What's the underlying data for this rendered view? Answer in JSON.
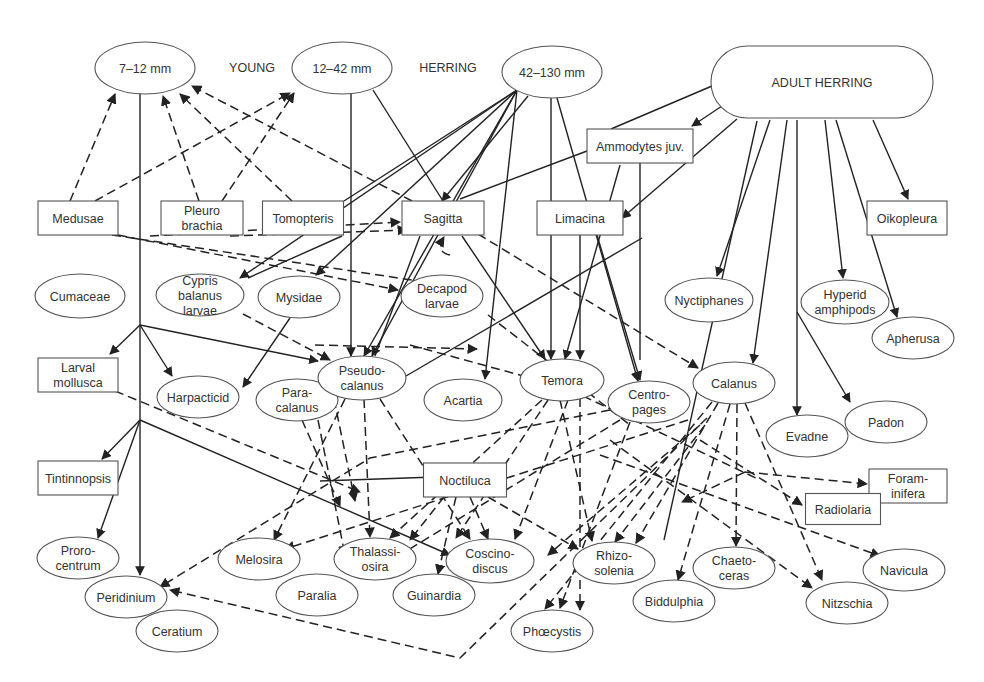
{
  "labels": {
    "young": "YOUNG",
    "herring": "HERRING"
  },
  "nodes": [
    {
      "id": "h712",
      "label": [
        "7–12 mm"
      ],
      "shape": "ellipse",
      "cx": 145,
      "cy": 68,
      "w": 100,
      "h": 52
    },
    {
      "id": "h1242",
      "label": [
        "12–42 mm"
      ],
      "shape": "ellipse",
      "cx": 342,
      "cy": 68,
      "w": 100,
      "h": 52
    },
    {
      "id": "h42130",
      "label": [
        "42–130 mm"
      ],
      "shape": "ellipse",
      "cx": 552,
      "cy": 72,
      "w": 100,
      "h": 52
    },
    {
      "id": "adult",
      "label": [
        "ADULT HERRING"
      ],
      "shape": "pill",
      "cx": 822,
      "cy": 82,
      "w": 222,
      "h": 72
    },
    {
      "id": "ammodytes",
      "label": [
        "Ammodytes juv."
      ],
      "shape": "rect",
      "cx": 640,
      "cy": 146,
      "w": 106,
      "h": 34
    },
    {
      "id": "medusae",
      "label": [
        "Medusae"
      ],
      "shape": "rect",
      "cx": 78,
      "cy": 218,
      "w": 80,
      "h": 34
    },
    {
      "id": "pleuro",
      "label": [
        "Pleuro",
        "brachia"
      ],
      "shape": "rect",
      "cx": 202,
      "cy": 218,
      "w": 82,
      "h": 34
    },
    {
      "id": "tomopteris",
      "label": [
        "Tomopteris"
      ],
      "shape": "rect",
      "cx": 303,
      "cy": 218,
      "w": 81,
      "h": 34
    },
    {
      "id": "sagitta",
      "label": [
        "Sagitta"
      ],
      "shape": "rect",
      "cx": 443,
      "cy": 218,
      "w": 82,
      "h": 34
    },
    {
      "id": "limacina",
      "label": [
        "Limacina"
      ],
      "shape": "rect",
      "cx": 580,
      "cy": 218,
      "w": 86,
      "h": 34
    },
    {
      "id": "oikopleura",
      "label": [
        "Oikopleura"
      ],
      "shape": "rect",
      "cx": 907,
      "cy": 218,
      "w": 80,
      "h": 34
    },
    {
      "id": "cumaceae",
      "label": [
        "Cumaceae"
      ],
      "shape": "ellipse",
      "cx": 80,
      "cy": 296,
      "w": 90,
      "h": 44
    },
    {
      "id": "cypris",
      "label": [
        "Cypris",
        "balanus",
        "larvae"
      ],
      "shape": "ellipse",
      "cx": 200,
      "cy": 295,
      "w": 88,
      "h": 42
    },
    {
      "id": "mysidae",
      "label": [
        "Mysidae"
      ],
      "shape": "ellipse",
      "cx": 299,
      "cy": 297,
      "w": 82,
      "h": 42
    },
    {
      "id": "decapod",
      "label": [
        "Decapod",
        "larvae"
      ],
      "shape": "ellipse",
      "cx": 442,
      "cy": 296,
      "w": 82,
      "h": 42
    },
    {
      "id": "nyctiphanes",
      "label": [
        "Nyctiphanes"
      ],
      "shape": "ellipse",
      "cx": 709,
      "cy": 300,
      "w": 88,
      "h": 44
    },
    {
      "id": "hyperid",
      "label": [
        "Hyperid",
        "amphipods"
      ],
      "shape": "ellipse",
      "cx": 845,
      "cy": 302,
      "w": 88,
      "h": 44
    },
    {
      "id": "apherusa",
      "label": [
        "Apherusa"
      ],
      "shape": "ellipse",
      "cx": 913,
      "cy": 338,
      "w": 82,
      "h": 42
    },
    {
      "id": "larvalmollusca",
      "label": [
        "Larval",
        "mollusca"
      ],
      "shape": "rect",
      "cx": 78,
      "cy": 375,
      "w": 80,
      "h": 34
    },
    {
      "id": "harpacticid",
      "label": [
        "Harpacticid"
      ],
      "shape": "ellipse",
      "cx": 198,
      "cy": 397,
      "w": 82,
      "h": 42
    },
    {
      "id": "paracalanus",
      "label": [
        "Para-",
        "calanus"
      ],
      "shape": "ellipse",
      "cx": 297,
      "cy": 400,
      "w": 82,
      "h": 42
    },
    {
      "id": "pseudocalanus",
      "label": [
        "Pseudo-",
        "calanus"
      ],
      "shape": "ellipse",
      "cx": 362,
      "cy": 378,
      "w": 88,
      "h": 44
    },
    {
      "id": "acartia",
      "label": [
        "Acartia"
      ],
      "shape": "ellipse",
      "cx": 463,
      "cy": 400,
      "w": 78,
      "h": 42
    },
    {
      "id": "temora",
      "label": [
        "Temora"
      ],
      "shape": "ellipse",
      "cx": 562,
      "cy": 380,
      "w": 84,
      "h": 42
    },
    {
      "id": "centropages",
      "label": [
        "Centro-",
        "pages"
      ],
      "shape": "ellipse",
      "cx": 649,
      "cy": 402,
      "w": 82,
      "h": 42
    },
    {
      "id": "calanus",
      "label": [
        "Calanus"
      ],
      "shape": "ellipse",
      "cx": 734,
      "cy": 383,
      "w": 82,
      "h": 42
    },
    {
      "id": "evadne",
      "label": [
        "Evadne"
      ],
      "shape": "ellipse",
      "cx": 807,
      "cy": 436,
      "w": 82,
      "h": 42
    },
    {
      "id": "padon",
      "label": [
        "Padon"
      ],
      "shape": "ellipse",
      "cx": 886,
      "cy": 422,
      "w": 82,
      "h": 42
    },
    {
      "id": "tintinnopsis",
      "label": [
        "Tintinnopsis"
      ],
      "shape": "rect",
      "cx": 78,
      "cy": 478,
      "w": 80,
      "h": 34
    },
    {
      "id": "noctiluca",
      "label": [
        "Noctiluca"
      ],
      "shape": "rect",
      "cx": 465,
      "cy": 480,
      "w": 83,
      "h": 34
    },
    {
      "id": "foraminifera",
      "label": [
        "Foram-",
        "inifera"
      ],
      "shape": "rect",
      "cx": 908,
      "cy": 486,
      "w": 78,
      "h": 34
    },
    {
      "id": "radiolaria",
      "label": [
        "Radiolaria"
      ],
      "shape": "rect",
      "cx": 843,
      "cy": 509,
      "w": 75,
      "h": 31
    },
    {
      "id": "prorocentrum",
      "label": [
        "Proro-",
        "centrum"
      ],
      "shape": "ellipse",
      "cx": 78,
      "cy": 558,
      "w": 82,
      "h": 42
    },
    {
      "id": "melosira",
      "label": [
        "Melosira"
      ],
      "shape": "ellipse",
      "cx": 259,
      "cy": 559,
      "w": 82,
      "h": 42
    },
    {
      "id": "thalassiosira",
      "label": [
        "Thalassi-",
        "osira"
      ],
      "shape": "ellipse",
      "cx": 375,
      "cy": 559,
      "w": 82,
      "h": 42
    },
    {
      "id": "coscinodiscus",
      "label": [
        "Coscino-",
        "discus"
      ],
      "shape": "ellipse",
      "cx": 490,
      "cy": 561,
      "w": 88,
      "h": 44
    },
    {
      "id": "rhizosolenia",
      "label": [
        "Rhizo-",
        "solenia"
      ],
      "shape": "ellipse",
      "cx": 614,
      "cy": 563,
      "w": 82,
      "h": 42
    },
    {
      "id": "chaetoceras",
      "label": [
        "Chaeto-",
        "ceras"
      ],
      "shape": "ellipse",
      "cx": 734,
      "cy": 568,
      "w": 82,
      "h": 42
    },
    {
      "id": "navicula",
      "label": [
        "Navicula"
      ],
      "shape": "ellipse",
      "cx": 904,
      "cy": 570,
      "w": 82,
      "h": 42
    },
    {
      "id": "peridinium",
      "label": [
        "Peridinium"
      ],
      "shape": "ellipse",
      "cx": 126,
      "cy": 597,
      "w": 82,
      "h": 42
    },
    {
      "id": "paralia",
      "label": [
        "Paralia"
      ],
      "shape": "ellipse",
      "cx": 317,
      "cy": 595,
      "w": 82,
      "h": 42
    },
    {
      "id": "guinardia",
      "label": [
        "Guinardia"
      ],
      "shape": "ellipse",
      "cx": 434,
      "cy": 595,
      "w": 82,
      "h": 42
    },
    {
      "id": "biddulphia",
      "label": [
        "Biddulphia"
      ],
      "shape": "ellipse",
      "cx": 674,
      "cy": 601,
      "w": 82,
      "h": 42
    },
    {
      "id": "nitzschia",
      "label": [
        "Nitzschia"
      ],
      "shape": "ellipse",
      "cx": 847,
      "cy": 603,
      "w": 82,
      "h": 42
    },
    {
      "id": "ceratium",
      "label": [
        "Ceratium"
      ],
      "shape": "ellipse",
      "cx": 177,
      "cy": 631,
      "w": 82,
      "h": 42
    },
    {
      "id": "phaeocystis",
      "label": [
        "Phœcystis"
      ],
      "shape": "ellipse",
      "cx": 552,
      "cy": 631,
      "w": 82,
      "h": 42
    }
  ],
  "edges": [
    {
      "d": "M 140 94 L 140 575",
      "style": "solid",
      "arrow": true
    },
    {
      "d": "M 140 325 L 110 354",
      "style": "solid",
      "arrow": true
    },
    {
      "d": "M 140 325 L 172 376",
      "style": "solid",
      "arrow": true
    },
    {
      "d": "M 140 325 L 318 361",
      "style": "solid",
      "arrow": true
    },
    {
      "d": "M 140 420 L 102 459",
      "style": "solid",
      "arrow": true
    },
    {
      "d": "M 140 420 L 98 538",
      "style": "solid",
      "arrow": true
    },
    {
      "d": "M 140 420 L 450 555",
      "style": "solid",
      "arrow": true
    },
    {
      "d": "M 351 94 L 351 356",
      "style": "solid",
      "arrow": true
    },
    {
      "d": "M 373 90 L 443 201",
      "style": "solid",
      "arrow": false
    },
    {
      "d": "M 517 90 L 344 201",
      "style": "solid",
      "arrow": false
    },
    {
      "d": "M 517 90 L 240 278",
      "style": "solid",
      "arrow": true
    },
    {
      "d": "M 517 90 L 316 275",
      "style": "solid",
      "arrow": true
    },
    {
      "d": "M 517 90 L 364 356",
      "style": "solid",
      "arrow": true
    },
    {
      "d": "M 517 90 L 372 356",
      "style": "solid",
      "arrow": true
    },
    {
      "d": "M 517 90 L 485 379",
      "style": "solid",
      "arrow": true
    },
    {
      "d": "M 528 96 L 442 201",
      "style": "solid",
      "arrow": true
    },
    {
      "d": "M 551 98 L 551 359",
      "style": "solid",
      "arrow": true
    },
    {
      "d": "M 557 98 L 638 381",
      "style": "solid",
      "arrow": true
    },
    {
      "d": "M 712 86 L 611 129",
      "style": "solid",
      "arrow": false
    },
    {
      "d": "M 722 106 L 692 126",
      "style": "solid",
      "arrow": true
    },
    {
      "d": "M 737 119 L 622 218",
      "style": "solid",
      "arrow": true
    },
    {
      "d": "M 757 121 L 664 540",
      "style": "solid",
      "arrow": false
    },
    {
      "d": "M 770 120 L 717 276",
      "style": "solid",
      "arrow": true
    },
    {
      "d": "M 787 120 L 753 363",
      "style": "solid",
      "arrow": true
    },
    {
      "d": "M 797 120 L 797 415",
      "style": "solid",
      "arrow": true
    },
    {
      "d": "M 825 120 L 843 278",
      "style": "solid",
      "arrow": true
    },
    {
      "d": "M 836 120 L 897 317",
      "style": "solid",
      "arrow": true
    },
    {
      "d": "M 873 120 L 908 199",
      "style": "solid",
      "arrow": true
    },
    {
      "d": "M 797 312 L 850 402",
      "style": "solid",
      "arrow": true
    },
    {
      "d": "M 587 151 L 460 199",
      "style": "solid",
      "arrow": false
    },
    {
      "d": "M 640 163 L 640 360",
      "style": "solid",
      "arrow": false
    },
    {
      "d": "M 620 165 L 565 359",
      "style": "solid",
      "arrow": true
    },
    {
      "d": "M 580 235 L 580 359",
      "style": "solid",
      "arrow": true
    },
    {
      "d": "M 597 235 L 640 380",
      "style": "solid",
      "arrow": true
    },
    {
      "d": "M 462 236 L 545 359",
      "style": "solid",
      "arrow": true
    },
    {
      "d": "M 420 236 L 375 356",
      "style": "solid",
      "arrow": false
    },
    {
      "d": "M 642 238 L 406 376",
      "style": "solid",
      "arrow": false
    },
    {
      "d": "M 290 318 L 243 387",
      "style": "solid",
      "arrow": true
    },
    {
      "d": "M 342 236 L 248 278",
      "style": "solid",
      "arrow": false
    },
    {
      "d": "M 464 476 L 320 481",
      "style": "solid",
      "arrow": false
    },
    {
      "d": "M 70 201 L 115 94",
      "style": "dash",
      "arrow": true
    },
    {
      "d": "M 95 201 L 290 93",
      "style": "dash",
      "arrow": true
    },
    {
      "d": "M 199 201 L 163 96",
      "style": "dash",
      "arrow": true
    },
    {
      "d": "M 222 201 L 294 93",
      "style": "dash",
      "arrow": true
    },
    {
      "d": "M 292 201 L 180 94",
      "style": "dash",
      "arrow": true
    },
    {
      "d": "M 412 201 L 192 86",
      "style": "dash",
      "arrow": true
    },
    {
      "d": "M 112 235 L 445 285",
      "style": "dash",
      "arrow": true
    },
    {
      "d": "M 118 235 L 398 290",
      "style": "dash",
      "arrow": true
    },
    {
      "d": "M 230 236 L 407 230",
      "style": "dash",
      "arrow": true
    },
    {
      "d": "M 150 236 L 400 222",
      "style": "dash",
      "arrow": true
    },
    {
      "d": "M 450 255 Q 435 252 444 237",
      "style": "dash",
      "arrow": true
    },
    {
      "d": "M 243 314 L 330 360",
      "style": "dash",
      "arrow": true
    },
    {
      "d": "M 315 345 L 477 349",
      "style": "dash",
      "arrow": true
    },
    {
      "d": "M 410 345 L 538 380",
      "style": "dash",
      "arrow": true
    },
    {
      "d": "M 478 234 L 698 368",
      "style": "dash",
      "arrow": true
    },
    {
      "d": "M 488 315 L 630 425",
      "style": "dash",
      "arrow": false
    },
    {
      "d": "M 115 391 L 360 492",
      "style": "dash",
      "arrow": true
    },
    {
      "d": "M 302 420 L 340 506",
      "style": "dash",
      "arrow": true
    },
    {
      "d": "M 318 420 L 345 555",
      "style": "dash",
      "arrow": true
    },
    {
      "d": "M 345 399 L 274 540",
      "style": "dash",
      "arrow": true
    },
    {
      "d": "M 364 399 L 370 537",
      "style": "dash",
      "arrow": true
    },
    {
      "d": "M 380 399 L 470 539",
      "style": "dash",
      "arrow": true
    },
    {
      "d": "M 334 399 L 355 501",
      "style": "dash",
      "arrow": true
    },
    {
      "d": "M 542 400 L 390 538",
      "style": "dash",
      "arrow": true
    },
    {
      "d": "M 548 400 L 456 538",
      "style": "dash",
      "arrow": true
    },
    {
      "d": "M 568 400 L 515 539",
      "style": "dash",
      "arrow": true
    },
    {
      "d": "M 580 398 L 580 610",
      "style": "dash",
      "arrow": true
    },
    {
      "d": "M 583 396 L 760 480",
      "style": "dash",
      "arrow": false
    },
    {
      "d": "M 610 410 L 370 458 L 160 587",
      "style": "dash",
      "arrow": true
    },
    {
      "d": "M 620 420 L 400 555",
      "style": "dash",
      "arrow": true
    },
    {
      "d": "M 630 422 L 560 608",
      "style": "dash",
      "arrow": true
    },
    {
      "d": "M 688 420 L 285 549",
      "style": "dash",
      "arrow": true
    },
    {
      "d": "M 700 425 L 548 555",
      "style": "dash",
      "arrow": true
    },
    {
      "d": "M 705 425 L 615 542",
      "style": "dash",
      "arrow": true
    },
    {
      "d": "M 712 402 L 545 609",
      "style": "dash",
      "arrow": true
    },
    {
      "d": "M 718 403 L 636 543",
      "style": "dash",
      "arrow": true
    },
    {
      "d": "M 730 404 L 678 580",
      "style": "dash",
      "arrow": true
    },
    {
      "d": "M 737 404 L 736 546",
      "style": "dash",
      "arrow": true
    },
    {
      "d": "M 745 403 L 822 580",
      "style": "dash",
      "arrow": true
    },
    {
      "d": "M 707 418 L 460 658 L 170 590",
      "style": "dash",
      "arrow": true
    },
    {
      "d": "M 600 455 L 880 556",
      "style": "dash",
      "arrow": true
    },
    {
      "d": "M 745 472 L 867 484",
      "style": "dash",
      "arrow": true
    },
    {
      "d": "M 745 472 L 682 502",
      "style": "dash",
      "arrow": true
    },
    {
      "d": "M 700 440 L 802 505",
      "style": "dash",
      "arrow": true
    },
    {
      "d": "M 610 440 L 812 588",
      "style": "dash",
      "arrow": true
    },
    {
      "d": "M 444 497 L 410 540",
      "style": "dash",
      "arrow": true
    },
    {
      "d": "M 456 497 L 438 574",
      "style": "dash",
      "arrow": true
    },
    {
      "d": "M 470 497 L 488 539",
      "style": "dash",
      "arrow": true
    },
    {
      "d": "M 488 497 L 578 549",
      "style": "dash",
      "arrow": true
    },
    {
      "d": "M 560 400 L 592 541",
      "style": "dash",
      "arrow": true
    }
  ]
}
